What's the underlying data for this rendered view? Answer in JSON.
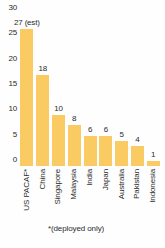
{
  "chart_data": {
    "type": "bar",
    "title": "",
    "subtitle": "",
    "xlabel": "",
    "ylabel": "",
    "categories": [
      "US PACAF*",
      "China",
      "Singapore",
      "Malaysia",
      "India",
      "Japan",
      "Australia",
      "Pakistan",
      "Indonesia"
    ],
    "values": [
      27,
      18,
      10,
      8,
      6,
      6,
      5,
      4,
      1
    ],
    "value_labels": [
      "27 (est)",
      "18",
      "10",
      "8",
      "6",
      "6",
      "5",
      "4",
      "1"
    ],
    "ylim": [
      0,
      30
    ],
    "yticks": [
      0,
      5,
      10,
      15,
      20,
      25,
      30
    ],
    "ytick_labels": [
      "0",
      "5",
      "10",
      "15",
      "20",
      "25",
      "30"
    ],
    "grid": false,
    "legend": null,
    "legend_position": "none",
    "annotations": [
      "*(deployed only)"
    ],
    "bar_color": "#facb62",
    "text_color": "#2b2b2b",
    "background_color": "#fefefe"
  },
  "footnote": "*(deployed only)"
}
